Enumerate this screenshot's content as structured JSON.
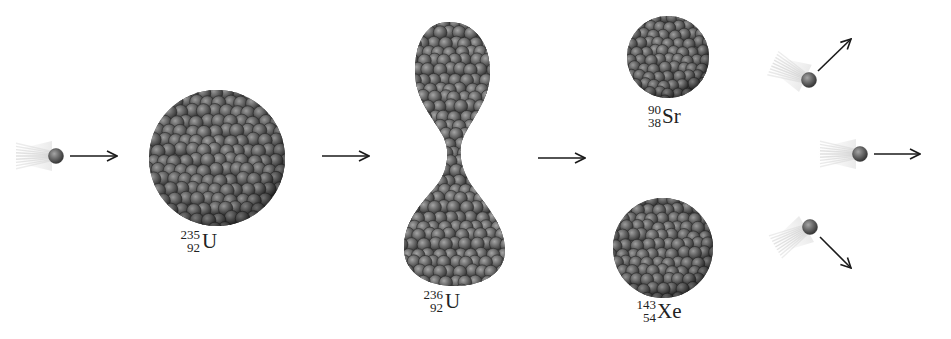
{
  "diagram": {
    "colors": {
      "nucleon": "#6b6b6b",
      "nucleon_highlight": "#9a9a9a",
      "nucleon_shadow": "#333333",
      "arrow": "#1a1a1a",
      "trail": "#cfcfcf",
      "background": "#ffffff"
    },
    "stages": [
      {
        "id": "incoming-neutron",
        "kind": "neutron",
        "x": 55,
        "y": 156
      },
      {
        "id": "u235",
        "kind": "nucleus",
        "symbol": "U",
        "mass": "235",
        "atomic_number": "92",
        "cx": 217,
        "cy": 158,
        "r": 68
      },
      {
        "id": "u236",
        "kind": "nucleus-deformed",
        "symbol": "U",
        "mass": "236",
        "atomic_number": "92"
      },
      {
        "id": "sr90",
        "kind": "nucleus",
        "symbol": "Sr",
        "mass": "90",
        "atomic_number": "38",
        "cx": 668,
        "cy": 57,
        "r": 41
      },
      {
        "id": "xe143",
        "kind": "nucleus",
        "symbol": "Xe",
        "mass": "143",
        "atomic_number": "54",
        "cx": 663,
        "cy": 248,
        "r": 50
      },
      {
        "id": "product-neutrons",
        "kind": "neutron-group",
        "count": 3
      }
    ],
    "labels": [
      {
        "id": "u235-label",
        "symbol": "U",
        "mass": "235",
        "atomic_number": "92",
        "x": 178,
        "y": 228
      },
      {
        "id": "u236-label",
        "symbol": "U",
        "mass": "236",
        "atomic_number": "92",
        "x": 422,
        "y": 289
      },
      {
        "id": "sr90-label",
        "symbol": "Sr",
        "mass": "90",
        "atomic_number": "38",
        "x": 646,
        "y": 104
      },
      {
        "id": "xe143-label",
        "symbol": "Xe",
        "mass": "143",
        "atomic_number": "54",
        "x": 635,
        "y": 300
      }
    ],
    "arrows": [
      {
        "id": "arrow-neutron-to-u235",
        "x1": 70,
        "y1": 156,
        "x2": 117,
        "y2": 156
      },
      {
        "id": "arrow-u235-to-u236",
        "x1": 322,
        "y1": 156,
        "x2": 369,
        "y2": 156
      },
      {
        "id": "arrow-u236-to-products",
        "x1": 538,
        "y1": 158,
        "x2": 585,
        "y2": 158
      },
      {
        "id": "arrow-neutron-up",
        "x1": 818,
        "y1": 71,
        "x2": 851,
        "y2": 39
      },
      {
        "id": "arrow-neutron-right",
        "x1": 874,
        "y1": 154,
        "x2": 920,
        "y2": 154
      },
      {
        "id": "arrow-neutron-down",
        "x1": 820,
        "y1": 237,
        "x2": 851,
        "y2": 268
      }
    ],
    "neutrons": [
      {
        "id": "neutron-incoming",
        "cx": 56,
        "cy": 156,
        "trail_angle": 180
      },
      {
        "id": "neutron-out-up",
        "cx": 809,
        "cy": 80,
        "trail_angle": 205
      },
      {
        "id": "neutron-out-right",
        "cx": 860,
        "cy": 154,
        "trail_angle": 180
      },
      {
        "id": "neutron-out-down",
        "cx": 810,
        "cy": 227,
        "trail_angle": 150
      }
    ]
  }
}
